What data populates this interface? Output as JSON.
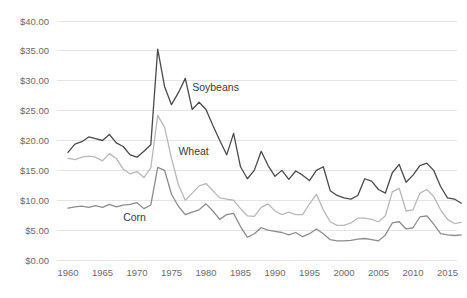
{
  "chart_data": {
    "type": "line",
    "title": "",
    "xlabel": "",
    "ylabel": "",
    "xlim": [
      1960,
      2017
    ],
    "ylim": [
      0,
      40
    ],
    "grid": true,
    "legend_position": "inline-annotations",
    "y_tick_labels": [
      "$40.00",
      "$35.00",
      "$30.00",
      "$25.00",
      "$20.00",
      "$15.00",
      "$10.00",
      "$5.00",
      "$0.00"
    ],
    "y_tick_values": [
      40,
      35,
      30,
      25,
      20,
      15,
      10,
      5,
      0
    ],
    "x_tick_labels": [
      "1960",
      "1965",
      "1970",
      "1975",
      "1980",
      "1985",
      "1990",
      "1995",
      "2000",
      "2005",
      "2010",
      "2015"
    ],
    "x_tick_values": [
      1960,
      1965,
      1970,
      1975,
      1980,
      1985,
      1990,
      1995,
      2000,
      2005,
      2010,
      2015
    ],
    "x": [
      1960,
      1961,
      1962,
      1963,
      1964,
      1965,
      1966,
      1967,
      1968,
      1969,
      1970,
      1971,
      1972,
      1973,
      1974,
      1975,
      1976,
      1977,
      1978,
      1979,
      1980,
      1981,
      1982,
      1983,
      1984,
      1985,
      1986,
      1987,
      1988,
      1989,
      1990,
      1991,
      1992,
      1993,
      1994,
      1995,
      1996,
      1997,
      1998,
      1999,
      2000,
      2001,
      2002,
      2003,
      2004,
      2005,
      2006,
      2007,
      2008,
      2009,
      2010,
      2011,
      2012,
      2013,
      2014,
      2015,
      2016,
      2017
    ],
    "series": [
      {
        "name": "Soybeans",
        "color": "#4a4a4a",
        "label_x": 1978,
        "label_y": 28.3,
        "values": [
          18.0,
          19.4,
          19.8,
          20.6,
          20.3,
          20.0,
          21.0,
          19.6,
          19.0,
          17.6,
          17.2,
          18.2,
          19.3,
          35.3,
          29.0,
          26.0,
          28.0,
          30.4,
          25.2,
          26.4,
          25.2,
          22.5,
          20.0,
          17.6,
          21.2,
          15.6,
          13.6,
          15.0,
          18.2,
          15.8,
          14.0,
          15.0,
          13.5,
          14.9,
          14.2,
          13.3,
          15.0,
          15.6,
          11.6,
          10.8,
          10.4,
          10.2,
          10.8,
          13.6,
          13.2,
          11.8,
          11.2,
          14.6,
          16.0,
          13.0,
          14.2,
          15.8,
          16.2,
          15.0,
          12.3,
          10.4,
          10.2,
          9.5
        ]
      },
      {
        "name": "Wheat",
        "color": "#b8b8b8",
        "label_x": 1976,
        "label_y": 17.5,
        "values": [
          17.0,
          16.8,
          17.2,
          17.4,
          17.2,
          16.6,
          17.8,
          17.0,
          15.2,
          14.4,
          14.8,
          13.8,
          15.4,
          24.2,
          22.2,
          17.0,
          12.6,
          10.0,
          11.2,
          12.4,
          12.8,
          11.6,
          10.4,
          10.2,
          10.0,
          8.6,
          7.4,
          7.3,
          8.8,
          9.4,
          8.2,
          7.6,
          8.0,
          7.6,
          7.6,
          9.4,
          11.0,
          8.4,
          6.4,
          5.8,
          5.8,
          6.2,
          7.0,
          7.0,
          6.8,
          6.4,
          7.4,
          11.4,
          12.0,
          8.2,
          8.4,
          11.2,
          11.8,
          10.6,
          8.4,
          6.8,
          6.1,
          6.3
        ]
      },
      {
        "name": "Corn",
        "color": "#8c8c8c",
        "label_x": 1968,
        "label_y": 6.6,
        "values": [
          8.7,
          8.9,
          9.0,
          8.8,
          9.1,
          8.8,
          9.3,
          8.9,
          9.2,
          9.3,
          9.6,
          8.6,
          9.2,
          15.5,
          15.0,
          11.0,
          9.0,
          7.6,
          8.0,
          8.4,
          9.4,
          8.2,
          6.8,
          7.6,
          7.8,
          5.6,
          3.8,
          4.4,
          5.4,
          5.0,
          4.8,
          4.6,
          4.2,
          4.6,
          3.9,
          4.4,
          5.2,
          4.4,
          3.4,
          3.2,
          3.2,
          3.3,
          3.5,
          3.6,
          3.4,
          3.2,
          4.2,
          6.2,
          6.4,
          5.2,
          5.4,
          7.2,
          7.4,
          6.0,
          4.4,
          4.2,
          4.1,
          4.2
        ]
      }
    ]
  }
}
